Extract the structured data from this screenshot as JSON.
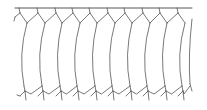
{
  "diagram": {
    "type": "cell-tissue-line-drawing",
    "cell_count": 10,
    "colors": {
      "background": "#ffffff",
      "line": "#555555"
    },
    "surface_line": {
      "x1": 15,
      "x2": 192,
      "y": 8
    },
    "top_junction_x": [
      19,
      37,
      55,
      72,
      89,
      107,
      124,
      142,
      159,
      177
    ],
    "cell_wall_x_top": [
      27,
      45,
      62,
      80,
      97,
      115,
      132,
      150,
      167,
      185,
      192
    ],
    "cell_wall_x_bottom": [
      24,
      42,
      60,
      77,
      95,
      112,
      130,
      147,
      165,
      182,
      190
    ],
    "wall_bulge": -6,
    "top_row_y": [
      8,
      13,
      19,
      23
    ],
    "bottom_row_y": [
      86,
      91,
      96,
      100
    ]
  }
}
